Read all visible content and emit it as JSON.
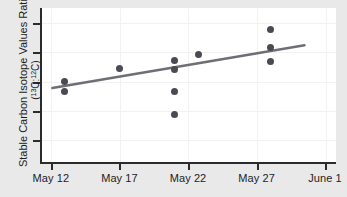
{
  "chart_data": {
    "type": "scatter",
    "title": "",
    "xlabel": "",
    "ylabel": "Stable Carbon Isotope Values Ratio",
    "ylabel_sub": "(13C:12C)",
    "ylabel_sub_parts": {
      "open": "(",
      "sup1": "13",
      "el1": "C:",
      "sup2": "12",
      "el2": "C)"
    },
    "grid": true,
    "legend": "none",
    "x_tick_labels": [
      "May 12",
      "May 17",
      "May 22",
      "May 27",
      "June 1"
    ],
    "x_tick_values": [
      12,
      17,
      22,
      27,
      32
    ],
    "xlim": [
      11.2,
      32.8
    ],
    "y_tick_labels": [
      "",
      "",
      "",
      "",
      ""
    ],
    "ylim": [
      0,
      5
    ],
    "y_axis_labeled": false,
    "y_tick_count": 5,
    "points": [
      {
        "label": "p1",
        "x": 13.0,
        "y": 2.62
      },
      {
        "label": "p2",
        "x": 13.0,
        "y": 2.3
      },
      {
        "label": "p3",
        "x": 17.0,
        "y": 3.05
      },
      {
        "label": "p4",
        "x": 21.0,
        "y": 3.3
      },
      {
        "label": "p5",
        "x": 21.0,
        "y": 3.02
      },
      {
        "label": "p6",
        "x": 21.0,
        "y": 2.32
      },
      {
        "label": "p7",
        "x": 21.0,
        "y": 1.55
      },
      {
        "label": "p8",
        "x": 22.8,
        "y": 3.5
      },
      {
        "label": "p9",
        "x": 28.0,
        "y": 4.3
      },
      {
        "label": "p10",
        "x": 28.0,
        "y": 3.72
      },
      {
        "label": "p11",
        "x": 28.0,
        "y": 3.28
      }
    ],
    "trend_line": {
      "name": "linear-fit",
      "x_start": 12.1,
      "y_start": 2.42,
      "x_end": 30.5,
      "y_end": 3.8,
      "color": "#6e6e76"
    },
    "colors": {
      "point": "#4a4a52",
      "trend": "#6e6e76",
      "axis": "#2b2b2b",
      "panel": "#ffffff",
      "background": "#e9e9e9",
      "grid": "#f2f2f2"
    }
  }
}
